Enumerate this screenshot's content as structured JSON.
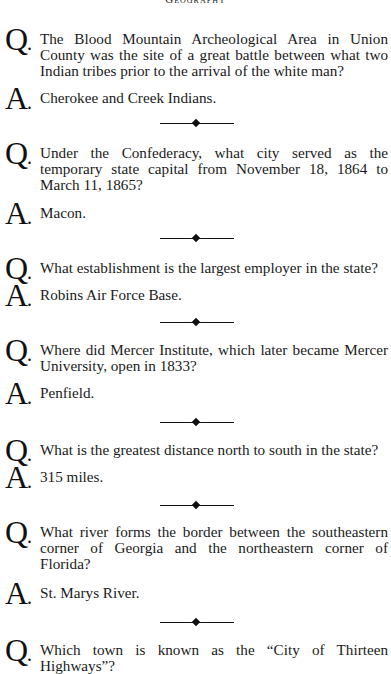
{
  "page": {
    "running_head": "Geography"
  },
  "items": [
    {
      "question": "The Blood Mountain Archeological Area in Union County was the site of a great battle between what two Indian tribes prior to the arrival of the white man?",
      "answer": "Cherokee and Creek Indians."
    },
    {
      "question": "Under the Confederacy, what city served as the temporary state capital from November 18, 1864 to March 11, 1865?",
      "answer": "Macon."
    },
    {
      "question": "What establishment is the largest employer in the state?",
      "answer": "Robins Air Force Base."
    },
    {
      "question": "Where did Mercer Institute, which later became Mercer University, open in 1833?",
      "answer": "Penfield."
    },
    {
      "question": "What is the greatest distance north to south in the state?",
      "answer": "315 miles."
    },
    {
      "question": "What river forms the border between the southeastern corner of Georgia and the northeastern corner of Florida?",
      "answer": "St. Marys River."
    },
    {
      "question": "Which town is known as the “City of Thirteen Highways”?"
    }
  ],
  "markers": {
    "question": "Q",
    "answer": "A",
    "dot": "."
  }
}
